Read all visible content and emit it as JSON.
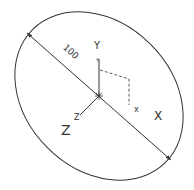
{
  "diagram": {
    "dimension_label": "100",
    "axes": {
      "y_label": "Y",
      "x_label": "X",
      "z_label": "Z",
      "y_small": "Y",
      "x_small": "x",
      "z_small": "Z"
    },
    "colors": {
      "stroke": "#333333",
      "background": "#ffffff"
    }
  }
}
